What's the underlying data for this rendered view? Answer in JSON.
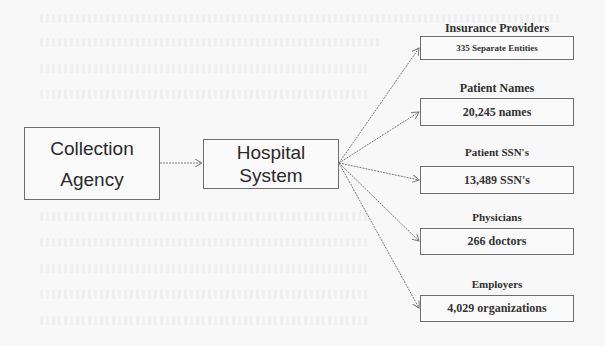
{
  "diagram": {
    "source": {
      "line1": "Collection",
      "line2": "Agency"
    },
    "hub": {
      "line1": "Hospital",
      "line2": "System"
    },
    "targets": [
      {
        "label": "Insurance Providers",
        "value": "335 Separate Entities"
      },
      {
        "label": "Patient Names",
        "value": "20,245 names"
      },
      {
        "label": "Patient SSN's",
        "value": "13,489 SSN's"
      },
      {
        "label": "Physicians",
        "value": "266 doctors"
      },
      {
        "label": "Employers",
        "value": "4,029 organizations"
      }
    ],
    "colors": {
      "background": "#f8f8f8",
      "border": "#6e6e6e",
      "arrow": "#7a7a7a",
      "text": "#2a2a2a"
    }
  }
}
